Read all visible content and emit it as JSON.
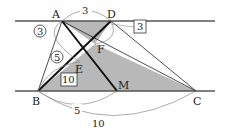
{
  "diagram": {
    "type": "geometry",
    "points": {
      "A": {
        "label": "A",
        "x": 62,
        "y": 21
      },
      "D": {
        "label": "D",
        "x": 111,
        "y": 21
      },
      "B": {
        "label": "B",
        "x": 38,
        "y": 91
      },
      "M": {
        "label": "M",
        "x": 117,
        "y": 91
      },
      "C": {
        "label": "C",
        "x": 196,
        "y": 91
      },
      "E": {
        "label": "E",
        "x": 80,
        "y": 62
      },
      "F": {
        "label": "F",
        "x": 95,
        "y": 44
      }
    },
    "labels": {
      "top_arc": "3",
      "bottom_arc_short": "5",
      "bottom_arc_long": "10",
      "circled_upper": "3",
      "circled_lower": "5",
      "boxed_upper": "3",
      "boxed_lower": "10"
    },
    "colors": {
      "line": "#222222",
      "shade": "#b8b8b8",
      "arc": "#888888"
    }
  }
}
